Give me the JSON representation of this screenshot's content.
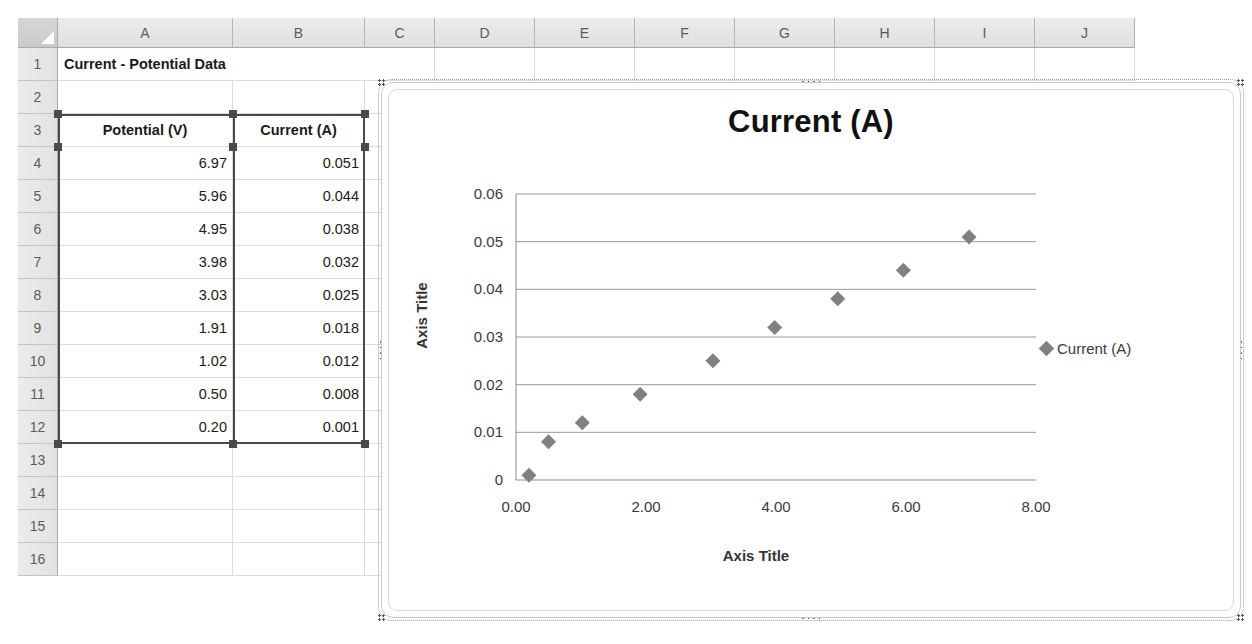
{
  "spreadsheet": {
    "column_headers": [
      "A",
      "B",
      "C",
      "D",
      "E",
      "F",
      "G",
      "H",
      "I",
      "J"
    ],
    "row_headers": [
      "1",
      "2",
      "3",
      "4",
      "5",
      "6",
      "7",
      "8",
      "9",
      "10",
      "11",
      "12",
      "13",
      "14",
      "15",
      "16"
    ],
    "title_cell": "Current - Potential Data",
    "table": {
      "headers": [
        "Potential (V)",
        "Current (A)"
      ],
      "rows": [
        [
          "6.97",
          "0.051"
        ],
        [
          "5.96",
          "0.044"
        ],
        [
          "4.95",
          "0.038"
        ],
        [
          "3.98",
          "0.032"
        ],
        [
          "3.03",
          "0.025"
        ],
        [
          "1.91",
          "0.018"
        ],
        [
          "1.02",
          "0.012"
        ],
        [
          "0.50",
          "0.008"
        ],
        [
          "0.20",
          "0.001"
        ]
      ]
    },
    "selection_range": "A3:B12"
  },
  "chart": {
    "title": "Current (A)",
    "legend_label": "Current (A)",
    "marker_color": "#808080",
    "axis_title_x": "Axis Title",
    "axis_title_y": "Axis Title"
  },
  "chart_data": {
    "type": "scatter",
    "title": "Current (A)",
    "xlabel": "Axis Title",
    "ylabel": "Axis Title",
    "xlim": [
      0,
      8
    ],
    "ylim": [
      0,
      0.06
    ],
    "xticks": [
      "0.00",
      "2.00",
      "4.00",
      "6.00",
      "8.00"
    ],
    "xtick_values": [
      0,
      2,
      4,
      6,
      8
    ],
    "yticks": [
      "0",
      "0.01",
      "0.02",
      "0.03",
      "0.04",
      "0.05",
      "0.06"
    ],
    "ytick_values": [
      0,
      0.01,
      0.02,
      0.03,
      0.04,
      0.05,
      0.06
    ],
    "grid": "horizontal",
    "legend_position": "right",
    "series": [
      {
        "name": "Current (A)",
        "marker": "diamond",
        "color": "#808080",
        "x": [
          6.97,
          5.96,
          4.95,
          3.98,
          3.03,
          1.91,
          1.02,
          0.5,
          0.2
        ],
        "y": [
          0.051,
          0.044,
          0.038,
          0.032,
          0.025,
          0.018,
          0.012,
          0.008,
          0.001
        ]
      }
    ]
  }
}
